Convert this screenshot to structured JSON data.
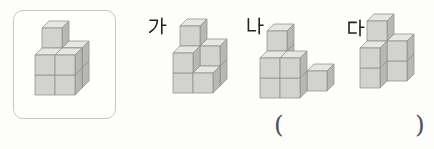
{
  "exercise": {
    "type": "cube-stacking-comparison-worksheet",
    "option_labels": {
      "ga": "가",
      "na": "나",
      "da": "다"
    },
    "answer_blank": {
      "open": "(",
      "close": ")"
    }
  },
  "figures": {
    "reference": {
      "cube_count": 9,
      "voxels": [
        [
          0,
          0,
          1
        ],
        [
          1,
          0,
          1
        ],
        [
          0,
          1,
          1
        ],
        [
          1,
          1,
          1
        ],
        [
          0,
          2,
          1
        ],
        [
          0,
          0,
          0
        ],
        [
          1,
          0,
          0
        ],
        [
          0,
          1,
          0
        ],
        [
          1,
          1,
          0
        ]
      ]
    },
    "ga": {
      "cube_count": 8,
      "voxels": [
        [
          0,
          0,
          1
        ],
        [
          1,
          0,
          1
        ],
        [
          0,
          1,
          1
        ],
        [
          1,
          1,
          1
        ],
        [
          0,
          2,
          1
        ],
        [
          0,
          0,
          0
        ],
        [
          1,
          0,
          0
        ],
        [
          0,
          1,
          0
        ]
      ]
    },
    "na": {
      "cube_count": 8,
      "voxels": [
        [
          0,
          0,
          1
        ],
        [
          0,
          1,
          1
        ],
        [
          0,
          2,
          1
        ],
        [
          2,
          0,
          1
        ],
        [
          0,
          0,
          0
        ],
        [
          1,
          0,
          0
        ],
        [
          0,
          1,
          0
        ],
        [
          1,
          1,
          0
        ]
      ]
    },
    "da": {
      "cube_count": 7,
      "voxels": [
        [
          0,
          0,
          1
        ],
        [
          0,
          1,
          1
        ],
        [
          1,
          0,
          1
        ],
        [
          1,
          1,
          1
        ],
        [
          0,
          2,
          1
        ],
        [
          0,
          0,
          0
        ],
        [
          0,
          1,
          0
        ]
      ]
    }
  },
  "cube_render": {
    "size": 20,
    "depth_dx": 7,
    "depth_dy": 7
  },
  "colors": {
    "cube_top": "#e6e6e3",
    "cube_front": "#d2d2d0",
    "cube_side": "#b7b7b4",
    "cube_edge": "#8f8f8c",
    "box_border": "#c7c7c4",
    "label_ink": "#222220",
    "paren_ink": "#515151",
    "paper": "#fdfdfc"
  }
}
